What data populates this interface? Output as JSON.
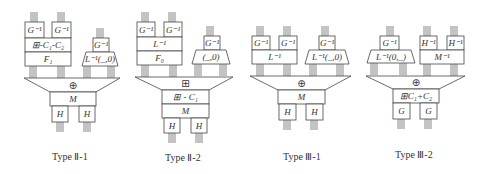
{
  "diagrams": [
    {
      "caption": "Type Ⅱ-1",
      "top_left_g": "G⁻¹",
      "top_right_g": "G⁻¹",
      "row1": "⊞-C₁-C₂",
      "row2": "F₁",
      "side_top": "G⁻¹",
      "side_trap": "L⁻¹(_,0)",
      "merge_op": "⊕",
      "mid": [
        "M"
      ],
      "bottom": [
        "H",
        "H"
      ]
    },
    {
      "caption": "Type Ⅱ-2",
      "top_left_g": "G⁻¹",
      "top_right_g": "G⁻¹",
      "row1": "L⁻¹",
      "row2": "F₀",
      "side_top": "G⁻¹",
      "side_trap": "(_,0)",
      "merge_op": "⊞",
      "mid": [
        "⊞ - C₁",
        "M"
      ],
      "bottom": [
        "H",
        "H"
      ]
    },
    {
      "caption": "Type Ⅲ-1",
      "top_left_g": "G⁻¹",
      "top_right_g": "G⁻¹",
      "row1": "L⁻¹",
      "side_top": "G⁻¹",
      "side_trap": "L⁻¹(_,0)",
      "merge_op": "⊕",
      "mid": [
        "M"
      ],
      "bottom": [
        "H",
        "H"
      ]
    },
    {
      "caption": "Type Ⅲ-2",
      "side_top": "G⁻¹",
      "side_trap": "L⁻¹(0,_)",
      "top_left_g": "H⁻¹",
      "top_right_g": "H⁻¹",
      "row1": "M⁻¹",
      "merge_op": "⊕",
      "mid": [
        "⊞C₁+C₂"
      ],
      "bottom": [
        "G",
        "G"
      ]
    }
  ]
}
